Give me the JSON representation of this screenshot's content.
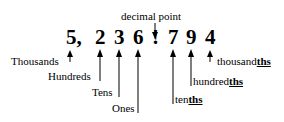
{
  "title_label": "decimal point",
  "number": {
    "digits": [
      {
        "char": "5,",
        "place": "Thousands"
      },
      {
        "char": "2",
        "place": "Hundreds"
      },
      {
        "char": "3",
        "place": "Tens"
      },
      {
        "char": "6",
        "place": "Ones"
      },
      {
        "char": "!",
        "place": "decimal point"
      },
      {
        "char": "7",
        "place": "tenths"
      },
      {
        "char": "9",
        "place": "hundredths"
      },
      {
        "char": "4",
        "place": "thousandths"
      }
    ]
  },
  "labels": {
    "thousands": "Thousands",
    "hundreds": "Hundreds",
    "tens": "Tens",
    "ones": "Ones",
    "tenths_stem": "ten",
    "tenths_suffix": "ths",
    "hundredths_stem": "hundred",
    "hundredths_suffix": "ths",
    "thousandths_stem": "thousand",
    "thousandths_suffix": "ths"
  },
  "colors": {
    "ink": "#000000",
    "background": "#ffffff"
  }
}
